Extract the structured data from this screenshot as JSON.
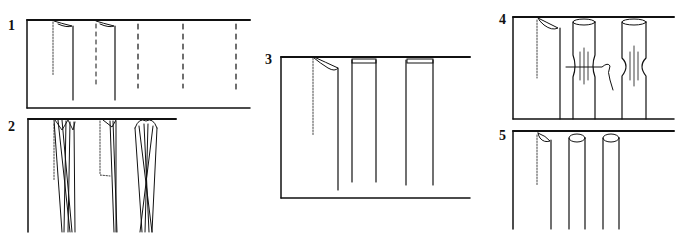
{
  "figure": {
    "type": "technical-sewing-diagram",
    "ink_color": "#111111",
    "background": "#ffffff",
    "panels": [
      {
        "label": "1",
        "description": "fabric strip with fold marks; two folded tucks at left, three dashed stitch lines to right"
      },
      {
        "label": "2",
        "description": "three pleated folds stitched at top, tapering toward bottom, with dotted stitch guide lines"
      },
      {
        "label": "3",
        "description": "one folded tuck with dotted guide, two flat box pleats stitched at top"
      },
      {
        "label": "4",
        "description": "folded tuck and two pleats gathered/pinched at middle with thread tie"
      },
      {
        "label": "5",
        "description": "one folded tuck and two rounded tubular pleats"
      }
    ]
  }
}
